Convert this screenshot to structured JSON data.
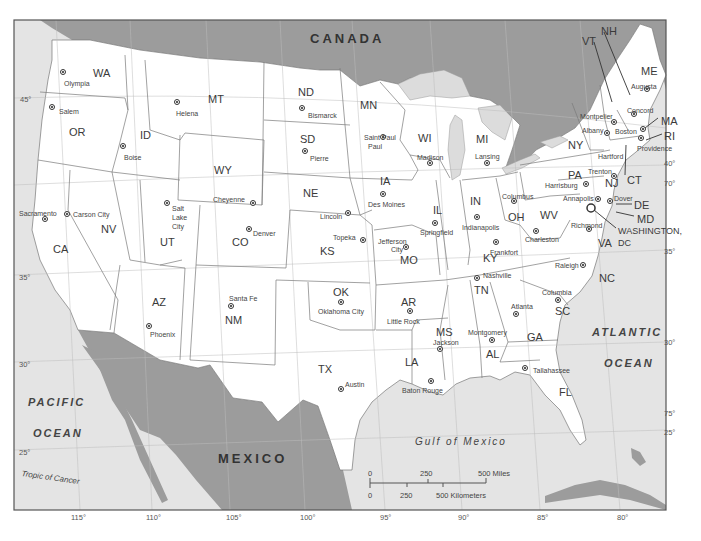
{
  "map": {
    "countries": [
      {
        "id": "canada",
        "label": "CANADA",
        "x": 310,
        "y": 32
      },
      {
        "id": "mexico",
        "label": "MEXICO",
        "x": 218,
        "y": 452
      }
    ],
    "water_bodies": [
      {
        "id": "pacific-1",
        "label": "PACIFIC",
        "x": 28,
        "y": 397,
        "cls": "oceanlbl"
      },
      {
        "id": "pacific-2",
        "label": "OCEAN",
        "x": 33,
        "y": 428,
        "cls": "oceanlbl"
      },
      {
        "id": "atlantic-1",
        "label": "ATLANTIC",
        "x": 592,
        "y": 327,
        "cls": "oceanlbl"
      },
      {
        "id": "atlantic-2",
        "label": "OCEAN",
        "x": 604,
        "y": 358,
        "cls": "oceanlbl"
      },
      {
        "id": "gulf",
        "label": "Gulf of Mexico",
        "x": 415,
        "y": 437,
        "cls": "gulf"
      }
    ],
    "annotations": {
      "tropic_of_cancer": "Tropic of Cancer"
    },
    "states": [
      {
        "abbr": "WA",
        "x": 93,
        "y": 68
      },
      {
        "abbr": "OR",
        "x": 69,
        "y": 127
      },
      {
        "abbr": "ID",
        "x": 140,
        "y": 130
      },
      {
        "abbr": "MT",
        "x": 208,
        "y": 94
      },
      {
        "abbr": "WY",
        "x": 214,
        "y": 165
      },
      {
        "abbr": "ND",
        "x": 298,
        "y": 87
      },
      {
        "abbr": "SD",
        "x": 300,
        "y": 134
      },
      {
        "abbr": "NE",
        "x": 303,
        "y": 188
      },
      {
        "abbr": "MN",
        "x": 360,
        "y": 100
      },
      {
        "abbr": "WI",
        "x": 418,
        "y": 133
      },
      {
        "abbr": "MI",
        "x": 476,
        "y": 134
      },
      {
        "abbr": "IA",
        "x": 380,
        "y": 176
      },
      {
        "abbr": "IL",
        "x": 433,
        "y": 205
      },
      {
        "abbr": "IN",
        "x": 470,
        "y": 196
      },
      {
        "abbr": "OH",
        "x": 508,
        "y": 212
      },
      {
        "abbr": "NY",
        "x": 568,
        "y": 140
      },
      {
        "abbr": "PA",
        "x": 568,
        "y": 170
      },
      {
        "abbr": "CA",
        "x": 53,
        "y": 244
      },
      {
        "abbr": "NV",
        "x": 101,
        "y": 224
      },
      {
        "abbr": "UT",
        "x": 160,
        "y": 237
      },
      {
        "abbr": "CO",
        "x": 232,
        "y": 237
      },
      {
        "abbr": "KS",
        "x": 320,
        "y": 246
      },
      {
        "abbr": "MO",
        "x": 400,
        "y": 255
      },
      {
        "abbr": "KY",
        "x": 483,
        "y": 253
      },
      {
        "abbr": "WV",
        "x": 540,
        "y": 210
      },
      {
        "abbr": "VA",
        "x": 598,
        "y": 238
      },
      {
        "abbr": "NC",
        "x": 599,
        "y": 273
      },
      {
        "abbr": "TN",
        "x": 474,
        "y": 285
      },
      {
        "abbr": "AZ",
        "x": 152,
        "y": 297
      },
      {
        "abbr": "NM",
        "x": 225,
        "y": 315
      },
      {
        "abbr": "OK",
        "x": 333,
        "y": 287
      },
      {
        "abbr": "AR",
        "x": 401,
        "y": 297
      },
      {
        "abbr": "TX",
        "x": 318,
        "y": 364
      },
      {
        "abbr": "MS",
        "x": 436,
        "y": 327
      },
      {
        "abbr": "AL",
        "x": 486,
        "y": 349
      },
      {
        "abbr": "GA",
        "x": 527,
        "y": 332
      },
      {
        "abbr": "SC",
        "x": 555,
        "y": 306
      },
      {
        "abbr": "LA",
        "x": 405,
        "y": 357
      },
      {
        "abbr": "FL",
        "x": 559,
        "y": 387
      },
      {
        "abbr": "ME",
        "x": 641,
        "y": 66
      },
      {
        "abbr": "NH",
        "x": 601,
        "y": 26
      },
      {
        "abbr": "VT",
        "x": 582,
        "y": 36
      },
      {
        "abbr": "MA",
        "x": 661,
        "y": 116
      },
      {
        "abbr": "RI",
        "x": 664,
        "y": 131
      },
      {
        "abbr": "CT",
        "x": 627,
        "y": 175
      },
      {
        "abbr": "NJ",
        "x": 605,
        "y": 178
      },
      {
        "abbr": "DE",
        "x": 634,
        "y": 200
      },
      {
        "abbr": "MD",
        "x": 637,
        "y": 214
      },
      {
        "abbr": "WASHINGTON,",
        "x": 618,
        "y": 227,
        "small": true
      },
      {
        "abbr": "DC",
        "x": 618,
        "y": 239,
        "small": true
      }
    ],
    "capitals": [
      {
        "name": "Olympia",
        "sx": 63,
        "sy": 72,
        "lx": 64,
        "ly": 80
      },
      {
        "name": "Salem",
        "sx": 52,
        "sy": 107,
        "lx": 59,
        "ly": 108
      },
      {
        "name": "Helena",
        "sx": 177,
        "sy": 102,
        "lx": 176,
        "ly": 110
      },
      {
        "name": "Boise",
        "sx": 123,
        "sy": 146,
        "lx": 124,
        "ly": 154
      },
      {
        "name": "Bismarck",
        "sx": 302,
        "sy": 108,
        "lx": 308,
        "ly": 112
      },
      {
        "name": "Pierre",
        "sx": 305,
        "sy": 151,
        "lx": 310,
        "ly": 155
      },
      {
        "name": "Saint Paul",
        "sx": 383,
        "sy": 137,
        "lx": 364,
        "ly": 134
      },
      {
        "name": "Paul",
        "sx": -1,
        "sy": -1,
        "lx": 368,
        "ly": 143
      },
      {
        "name": "Madison",
        "sx": 430,
        "sy": 163,
        "lx": 417,
        "ly": 154
      },
      {
        "name": "Lansing",
        "sx": 487,
        "sy": 163,
        "lx": 475,
        "ly": 153
      },
      {
        "name": "Des Moines",
        "sx": 383,
        "sy": 194,
        "lx": 368,
        "ly": 201
      },
      {
        "name": "Cheyenne",
        "sx": 253,
        "sy": 203,
        "lx": 213,
        "ly": 196
      },
      {
        "name": "Lincoln",
        "sx": 348,
        "sy": 213,
        "lx": 320,
        "ly": 213
      },
      {
        "name": "Denver",
        "sx": 249,
        "sy": 229,
        "lx": 253,
        "ly": 230
      },
      {
        "name": "Salt",
        "sx": 167,
        "sy": 203,
        "lx": 172,
        "ly": 205
      },
      {
        "name": "Lake",
        "sx": -1,
        "sy": -1,
        "lx": 172,
        "ly": 214
      },
      {
        "name": "City",
        "sx": -1,
        "sy": -1,
        "lx": 172,
        "ly": 223
      },
      {
        "name": "Sacramento",
        "sx": 45,
        "sy": 219,
        "lx": 19,
        "ly": 210
      },
      {
        "name": "Carson City",
        "sx": 67,
        "sy": 214,
        "lx": 73,
        "ly": 211
      },
      {
        "name": "Topeka",
        "sx": 363,
        "sy": 240,
        "lx": 333,
        "ly": 234
      },
      {
        "name": "Jefferson",
        "sx": -1,
        "sy": -1,
        "lx": 378,
        "ly": 238
      },
      {
        "name": "City",
        "sx": 406,
        "sy": 247,
        "lx": 391,
        "ly": 246
      },
      {
        "name": "Springfield",
        "sx": 435,
        "sy": 223,
        "lx": 420,
        "ly": 229
      },
      {
        "name": "Indianapolis",
        "sx": 477,
        "sy": 217,
        "lx": 462,
        "ly": 224
      },
      {
        "name": "Columbus",
        "sx": 514,
        "sy": 201,
        "lx": 502,
        "ly": 193
      },
      {
        "name": "Frankfort",
        "sx": 496,
        "sy": 242,
        "lx": 490,
        "ly": 249
      },
      {
        "name": "Charleston",
        "sx": 536,
        "sy": 231,
        "lx": 525,
        "ly": 236
      },
      {
        "name": "Richmond",
        "sx": 589,
        "sy": 229,
        "lx": 571,
        "ly": 222
      },
      {
        "name": "Harrisburg",
        "sx": 586,
        "sy": 184,
        "lx": 545,
        "ly": 182
      },
      {
        "name": "Annapolis",
        "sx": 598,
        "sy": 199,
        "lx": 563,
        "ly": 195
      },
      {
        "name": "Dover",
        "sx": 610,
        "sy": 201,
        "lx": 614,
        "ly": 195
      },
      {
        "name": "Trenton",
        "sx": 614,
        "sy": 176,
        "lx": 588,
        "ly": 168
      },
      {
        "name": "Hartford",
        "sx": -1,
        "sy": -1,
        "lx": 598,
        "ly": 153
      },
      {
        "name": "Albany",
        "sx": 607,
        "sy": 133,
        "lx": 582,
        "ly": 127
      },
      {
        "name": "Montpelier",
        "sx": 614,
        "sy": 122,
        "lx": 580,
        "ly": 113
      },
      {
        "name": "Concord",
        "sx": 634,
        "sy": 114,
        "lx": 627,
        "ly": 107
      },
      {
        "name": "Augusta",
        "sx": 647,
        "sy": 89,
        "lx": 631,
        "ly": 83
      },
      {
        "name": "Boston",
        "sx": 643,
        "sy": 129,
        "lx": 615,
        "ly": 128
      },
      {
        "name": "Providence",
        "sx": 641,
        "sy": 138,
        "lx": 637,
        "ly": 145
      },
      {
        "name": "Nashville",
        "sx": 477,
        "sy": 278,
        "lx": 483,
        "ly": 272
      },
      {
        "name": "Raleigh",
        "sx": 583,
        "sy": 265,
        "lx": 555,
        "ly": 262
      },
      {
        "name": "Santa Fe",
        "sx": 231,
        "sy": 306,
        "lx": 229,
        "ly": 295
      },
      {
        "name": "Phoenix",
        "sx": 149,
        "sy": 326,
        "lx": 150,
        "ly": 331
      },
      {
        "name": "Oklahoma City",
        "sx": 341,
        "sy": 302,
        "lx": 318,
        "ly": 308
      },
      {
        "name": "Little Rock",
        "sx": 410,
        "sy": 311,
        "lx": 387,
        "ly": 318
      },
      {
        "name": "Columbia",
        "sx": 558,
        "sy": 300,
        "lx": 542,
        "ly": 289
      },
      {
        "name": "Atlanta",
        "sx": 516,
        "sy": 314,
        "lx": 511,
        "ly": 303
      },
      {
        "name": "Jackson",
        "sx": 440,
        "sy": 349,
        "lx": 433,
        "ly": 339
      },
      {
        "name": "Montgomery",
        "sx": 492,
        "sy": 340,
        "lx": 468,
        "ly": 329
      },
      {
        "name": "Tallahassee",
        "sx": 525,
        "sy": 368,
        "lx": 533,
        "ly": 367
      },
      {
        "name": "Austin",
        "sx": 341,
        "sy": 389,
        "lx": 345,
        "ly": 381
      },
      {
        "name": "Baton Rouge",
        "sx": 431,
        "sy": 381,
        "lx": 402,
        "ly": 387
      }
    ],
    "latitude_labels": [
      {
        "label": "45°",
        "x": 20,
        "y": 96
      },
      {
        "label": "35°",
        "x": 19,
        "y": 274
      },
      {
        "label": "30°",
        "x": 19,
        "y": 361
      },
      {
        "label": "25°",
        "x": 19,
        "y": 449
      },
      {
        "label": "40°",
        "x": 664,
        "y": 160
      },
      {
        "label": "35°",
        "x": 664,
        "y": 248
      },
      {
        "label": "30°",
        "x": 664,
        "y": 339
      },
      {
        "label": "25°",
        "x": 664,
        "y": 429
      }
    ],
    "longitude_labels": [
      {
        "label": "115°",
        "x": 71,
        "y": 514
      },
      {
        "label": "110°",
        "x": 146,
        "y": 514
      },
      {
        "label": "105°",
        "x": 226,
        "y": 514
      },
      {
        "label": "100°",
        "x": 300,
        "y": 514
      },
      {
        "label": "95°",
        "x": 380,
        "y": 514
      },
      {
        "label": "90°",
        "x": 458,
        "y": 514
      },
      {
        "label": "85°",
        "x": 537,
        "y": 514
      },
      {
        "label": "80°",
        "x": 617,
        "y": 514
      },
      {
        "label": "70°",
        "x": 664,
        "y": 180
      },
      {
        "label": "75°",
        "x": 664,
        "y": 410
      }
    ],
    "scale_bar": {
      "miles_0": "0",
      "miles_250": "250",
      "miles_500": "500 Miles",
      "km_0": "0",
      "km_250": "250",
      "km_500": "500 Kilometers"
    }
  }
}
